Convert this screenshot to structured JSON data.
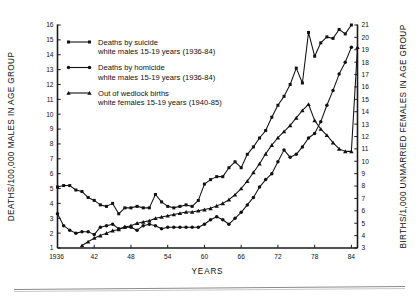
{
  "chart_data": {
    "type": "line",
    "title": "",
    "xlabel": "YEARS",
    "ylabel": "DEATHS/100,000 MALES IN AGE GROUP",
    "y2label": "BIRTHS/1,000 UNMARRIED FEMALES IN AGE GROUP",
    "xlim": [
      1936,
      1985
    ],
    "ylim": [
      1,
      16
    ],
    "y2lim": [
      3,
      21
    ],
    "grid": false,
    "legend_position": "upper-left",
    "xticks": [
      "1936",
      "42",
      "48",
      "54",
      "60",
      "66",
      "72",
      "78",
      "84"
    ],
    "xtick_values": [
      1936,
      1942,
      1948,
      1954,
      1960,
      1966,
      1972,
      1978,
      1984
    ],
    "yticks": [
      "1",
      "2",
      "3",
      "4",
      "5",
      "6",
      "7",
      "8",
      "9",
      "10",
      "11",
      "12",
      "13",
      "14",
      "15",
      "16"
    ],
    "y2ticks": [
      "3",
      "4",
      "5",
      "6",
      "7",
      "8",
      "9",
      "10",
      "11",
      "12",
      "13",
      "14",
      "15",
      "16",
      "17",
      "18",
      "19",
      "20",
      "21"
    ],
    "series": [
      {
        "name": "Deaths by suicide",
        "sublabel": "white males 15-19 years (1936-84)",
        "marker": "square",
        "axis": "left",
        "x": [
          1936,
          1937,
          1938,
          1939,
          1940,
          1941,
          1942,
          1943,
          1944,
          1945,
          1946,
          1947,
          1948,
          1949,
          1950,
          1951,
          1952,
          1953,
          1954,
          1955,
          1956,
          1957,
          1958,
          1959,
          1960,
          1961,
          1962,
          1963,
          1964,
          1965,
          1966,
          1967,
          1968,
          1969,
          1970,
          1971,
          1972,
          1973,
          1974,
          1975,
          1976,
          1977,
          1978,
          1979,
          1980,
          1981,
          1982,
          1983,
          1984
        ],
        "values": [
          5.1,
          5.2,
          5.2,
          4.9,
          4.8,
          4.4,
          4.2,
          3.9,
          3.8,
          4.0,
          3.3,
          3.7,
          3.7,
          3.8,
          3.7,
          3.7,
          4.6,
          4.1,
          3.8,
          3.7,
          3.8,
          3.9,
          3.8,
          4.2,
          5.3,
          5.6,
          5.8,
          5.8,
          6.4,
          6.8,
          6.4,
          7.3,
          7.8,
          8.4,
          8.9,
          9.8,
          10.6,
          11.2,
          12.0,
          13.1,
          12.1,
          15.5,
          13.9,
          14.8,
          15.2,
          15.1,
          15.7,
          15.4,
          16.0
        ]
      },
      {
        "name": "Deaths by homicide",
        "sublabel": "white males 15-19 years (1936-84)",
        "marker": "circle",
        "axis": "left",
        "x": [
          1936,
          1937,
          1938,
          1939,
          1940,
          1941,
          1942,
          1943,
          1944,
          1945,
          1946,
          1947,
          1948,
          1949,
          1950,
          1951,
          1952,
          1953,
          1954,
          1955,
          1956,
          1957,
          1958,
          1959,
          1960,
          1961,
          1962,
          1963,
          1964,
          1965,
          1966,
          1967,
          1968,
          1969,
          1970,
          1971,
          1972,
          1973,
          1974,
          1975,
          1976,
          1977,
          1978,
          1979,
          1980,
          1981,
          1982,
          1983,
          1984
        ],
        "values": [
          3.3,
          2.5,
          2.2,
          2.0,
          2.1,
          2.1,
          1.9,
          2.4,
          2.5,
          2.6,
          2.3,
          2.4,
          2.4,
          2.2,
          2.5,
          2.6,
          2.5,
          2.3,
          2.4,
          2.4,
          2.4,
          2.4,
          2.4,
          2.4,
          2.6,
          2.9,
          3.1,
          2.9,
          2.6,
          3.0,
          3.4,
          3.9,
          4.4,
          5.1,
          5.6,
          6.0,
          6.8,
          7.6,
          7.1,
          7.3,
          7.8,
          8.4,
          8.7,
          9.5,
          10.6,
          11.6,
          12.7,
          13.5,
          14.5
        ]
      },
      {
        "name": "Out of wedlock births",
        "sublabel": "white females 15-19 years (1940-85)",
        "marker": "triangle",
        "axis": "right",
        "x": [
          1940,
          1941,
          1942,
          1943,
          1944,
          1945,
          1946,
          1947,
          1948,
          1949,
          1950,
          1951,
          1952,
          1953,
          1954,
          1955,
          1956,
          1957,
          1958,
          1959,
          1960,
          1961,
          1962,
          1963,
          1964,
          1965,
          1966,
          1967,
          1968,
          1969,
          1970,
          1971,
          1972,
          1973,
          1974,
          1975,
          1976,
          1977,
          1978,
          1979,
          1980,
          1981,
          1982,
          1983,
          1984,
          1985
        ],
        "values": [
          3.2,
          3.5,
          3.8,
          4.0,
          4.2,
          4.4,
          4.5,
          4.7,
          4.8,
          5.0,
          5.1,
          5.2,
          5.4,
          5.5,
          5.6,
          5.7,
          5.8,
          5.9,
          5.9,
          6.0,
          6.1,
          6.2,
          6.4,
          6.6,
          6.9,
          7.3,
          7.8,
          8.4,
          9.1,
          9.8,
          10.6,
          11.3,
          11.9,
          12.4,
          12.9,
          13.5,
          14.1,
          14.6,
          13.3,
          12.6,
          12.1,
          11.5,
          11.0,
          10.8,
          10.8,
          19.2
        ]
      }
    ]
  },
  "legend": {
    "items": [
      {
        "label": "Deaths by suicide",
        "sublabel": "white males 15-19 years (1936-84)",
        "marker": "square"
      },
      {
        "label": "Deaths by homicide",
        "sublabel": "white males 15-19 years (1936-84)",
        "marker": "circle"
      },
      {
        "label": "Out of wedlock births",
        "sublabel": "white females 15-19 years (1940-85)",
        "marker": "triangle"
      }
    ]
  },
  "colors": {
    "ink": "#111111",
    "rule_top": "#8a8a8a",
    "rule_bottom": "#c9c9c9"
  }
}
